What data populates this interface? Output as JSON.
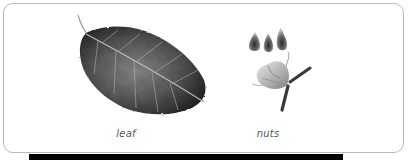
{
  "figure_panel": {
    "items": [
      {
        "id": "leaf",
        "caption": "leaf",
        "illustration": "leaf-illustration"
      },
      {
        "id": "nuts",
        "caption": "nuts",
        "illustration": "nuts-illustration"
      }
    ],
    "colors": {
      "panel_border": "#b9b9b9",
      "caption_text": "#555555",
      "leaf_dark": "#2b2b2b",
      "leaf_mid": "#6b6b6b",
      "leaf_light": "#a8a8a8",
      "bar": "#000000"
    }
  }
}
